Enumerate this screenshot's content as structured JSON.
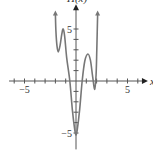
{
  "chart_data": {
    "type": "line",
    "title": "",
    "xlabel": "x",
    "ylabel": "H(x)",
    "xlim": [
      -6.5,
      6.5
    ],
    "ylim": [
      -6,
      7
    ],
    "x_ticks": [
      -6,
      -5,
      -4,
      -3,
      -2,
      -1,
      1,
      2,
      3,
      4,
      5,
      6
    ],
    "y_ticks": [
      -5,
      -4,
      -3,
      -2,
      -1,
      1,
      2,
      3,
      4,
      5
    ],
    "x_tick_labels": [
      {
        "value": -5,
        "label": "−5"
      },
      {
        "value": 5,
        "label": "5"
      }
    ],
    "y_tick_labels": [
      {
        "value": 5,
        "label": "5"
      },
      {
        "value": -5,
        "label": "−5"
      }
    ],
    "grid": false,
    "series": [
      {
        "name": "H(x)",
        "color": "#777777",
        "arrows": [
          "start",
          "end"
        ],
        "points": [
          [
            -2.0,
            6.4
          ],
          [
            -1.95,
            4.8
          ],
          [
            -1.85,
            3.4
          ],
          [
            -1.72,
            2.8
          ],
          [
            -1.55,
            3.4
          ],
          [
            -1.38,
            4.5
          ],
          [
            -1.25,
            5.0
          ],
          [
            -1.1,
            4.3
          ],
          [
            -0.9,
            2.2
          ],
          [
            -0.6,
            0.0
          ],
          [
            -0.35,
            -2.8
          ],
          [
            -0.12,
            -4.7
          ],
          [
            0.0,
            -5.2
          ],
          [
            0.12,
            -4.7
          ],
          [
            0.35,
            -2.8
          ],
          [
            0.6,
            0.0
          ],
          [
            0.85,
            1.9
          ],
          [
            1.15,
            2.6
          ],
          [
            1.4,
            2.0
          ],
          [
            1.62,
            0.4
          ],
          [
            1.82,
            -0.8
          ],
          [
            1.95,
            0.6
          ],
          [
            2.02,
            3.0
          ],
          [
            2.1,
            6.4
          ]
        ]
      }
    ]
  }
}
